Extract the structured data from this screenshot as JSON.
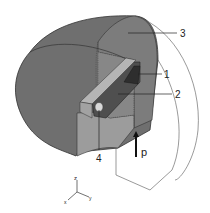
{
  "figure": {
    "type": "3d-cutaway-diagram",
    "labels": [
      {
        "id": "1",
        "text": "1",
        "x": 166,
        "y": 77
      },
      {
        "id": "2",
        "text": "2",
        "x": 177,
        "y": 98
      },
      {
        "id": "3",
        "text": "3",
        "x": 182,
        "y": 36
      },
      {
        "id": "4",
        "text": "4",
        "x": 99,
        "y": 156
      }
    ],
    "force": {
      "label": "p"
    },
    "axes": {
      "z": "z",
      "x": "x",
      "y": "y"
    },
    "colors": {
      "shell_dark": "#6e6e6e",
      "shell_mid": "#8a8a8a",
      "cut_face": "#9a9a9a",
      "slot": "#505050",
      "rod": "#b8b8b8",
      "outline": "#3a3a3a",
      "background": "#ffffff"
    }
  }
}
